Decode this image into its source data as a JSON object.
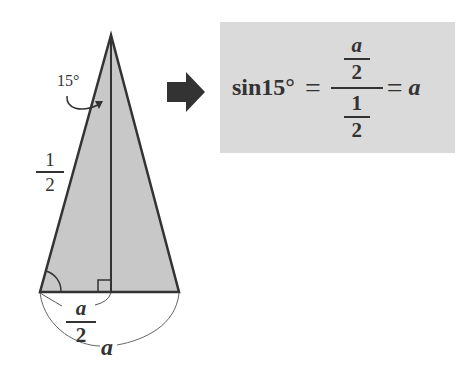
{
  "diagram": {
    "triangle": {
      "fill": "#c8c8c8",
      "stroke": "#333333",
      "apex_angle_label": "15°",
      "side_label": {
        "numerator": "1",
        "denominator": "2"
      },
      "half_base_label": {
        "numerator": "a",
        "denominator": "2"
      },
      "base_label": "a"
    },
    "arrow": {
      "color": "#333333",
      "icon": "right-arrow-icon"
    },
    "formula": {
      "background": "#dadada",
      "lhs": "sin15°",
      "eq1": "=",
      "big_num": {
        "numerator": "a",
        "denominator": "2"
      },
      "big_den": {
        "numerator": "1",
        "denominator": "2"
      },
      "eq2": "=",
      "rhs": "a"
    }
  }
}
